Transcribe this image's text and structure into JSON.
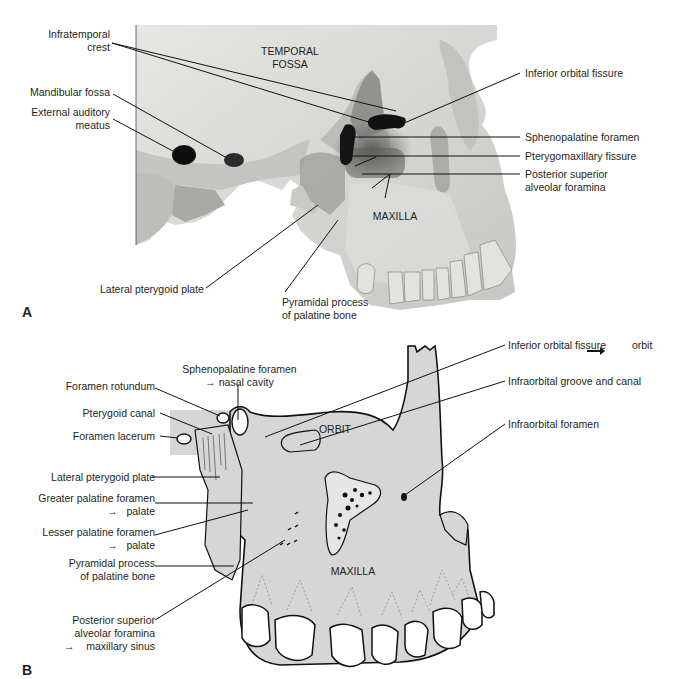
{
  "figure": {
    "panel_a": {
      "letter": "A",
      "type": "photograph",
      "region_labels": {
        "temporal_fossa_1": "TEMPORAL",
        "temporal_fossa_2": "FOSSA",
        "maxilla": "MAXILLA"
      },
      "left_labels": [
        {
          "line1": "Infratemporal",
          "line2": "crest"
        },
        {
          "line1": "Mandibular fossa"
        },
        {
          "line1": "External auditory",
          "line2": "meatus"
        }
      ],
      "right_labels": [
        {
          "line1": "Inferior orbital fissure"
        },
        {
          "line1": "Sphenopalatine foramen"
        },
        {
          "line1": "Pterygomaxillary fissure"
        },
        {
          "line1": "Posterior superior",
          "line2": "alveolar foramina"
        }
      ],
      "bottom_labels": [
        {
          "line1": "Lateral pterygoid plate"
        },
        {
          "line1": "Pyramidal process",
          "line2": "of palatine bone"
        }
      ]
    },
    "panel_b": {
      "letter": "B",
      "type": "line drawing",
      "region_labels": {
        "orbit": "ORBIT",
        "maxilla": "MAXILLA"
      },
      "top_label": {
        "line1": "Sphenopalatine foramen",
        "arrow": "→",
        "line2": "nasal cavity"
      },
      "left_labels": [
        {
          "line1": "Foramen rotundum"
        },
        {
          "line1": "Pterygoid canal"
        },
        {
          "line1": "Foramen lacerum"
        },
        {
          "line1": "Lateral pterygoid plate"
        },
        {
          "line1": "Greater palatine foramen",
          "arrow": "→",
          "line2": "palate"
        },
        {
          "line1": "Lesser palatine foramen",
          "arrow": "→",
          "line2": "palate"
        },
        {
          "line1": "Pyramidal process",
          "line2": "of palatine bone"
        },
        {
          "line1": "Posterior superior",
          "line2": "alveolar foramina",
          "arrow": "→",
          "line3": "maxillary sinus"
        }
      ],
      "right_labels": [
        {
          "line1": "Inferior orbital fissure",
          "arrow": "→",
          "line2": "orbit"
        },
        {
          "line1": "Infraorbital groove and canal"
        },
        {
          "line1": "Infraorbital foramen"
        }
      ]
    }
  },
  "colors": {
    "bone_photo": "#d9d9d6",
    "bone_drawing": "#d6d6d6",
    "ink": "#231f20",
    "shadow": "#3a3a3a"
  }
}
